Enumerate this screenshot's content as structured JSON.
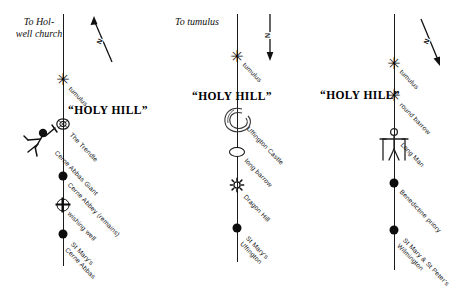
{
  "panels": [
    {
      "id": "cerne",
      "name": "Cerne Abbas alignment",
      "top_note": "To Hol-\nwell church",
      "holy_hill": "“HOLY HILL”",
      "north_label": "N",
      "north_direction": "up-left",
      "figure": "cerne-abbas-giant",
      "sites": [
        {
          "label": "tumulus",
          "symbol": "star"
        },
        {
          "label": "The Trendle",
          "symbol": "hill-figure"
        },
        {
          "label": "Cerne Abbas Giant",
          "symbol": "none"
        },
        {
          "label": "Cerne Abbey (remains)",
          "symbol": "dot"
        },
        {
          "label": "wishing well",
          "symbol": "crossed-circle"
        },
        {
          "label": "St Mary's\nCerne Abbas",
          "symbol": "dot"
        }
      ]
    },
    {
      "id": "uffington",
      "name": "Uffington alignment",
      "top_note": "To tumulus",
      "holy_hill": "“HOLY  HILL”",
      "north_label": "N",
      "north_direction": "down",
      "figure": "uffington-castle",
      "sites": [
        {
          "label": "tumulus",
          "symbol": "star"
        },
        {
          "label": "Uffington Castle",
          "symbol": "hillfort"
        },
        {
          "label": "long barrow",
          "symbol": "ellipse"
        },
        {
          "label": "Dragon Hill",
          "symbol": "starburst"
        },
        {
          "label": "St Mary's\nUffington",
          "symbol": "dot"
        }
      ]
    },
    {
      "id": "wilmington",
      "name": "Wilmington alignment",
      "top_note": "",
      "holy_hill": "“HOLY HILL”",
      "north_label": "N",
      "north_direction": "down-right",
      "figure": "long-man-of-wilmington",
      "sites": [
        {
          "label": "tumulus",
          "symbol": "star"
        },
        {
          "label": "round barrow",
          "symbol": "star"
        },
        {
          "label": "Long Man",
          "symbol": "hill-figure"
        },
        {
          "label": "Benedictine priory",
          "symbol": "dot"
        },
        {
          "label": "St Mary & St Peter's\nWilmington",
          "symbol": "dot"
        }
      ]
    }
  ],
  "colors": {
    "ink": "#0d0d0d",
    "paper": "#ffffff"
  }
}
